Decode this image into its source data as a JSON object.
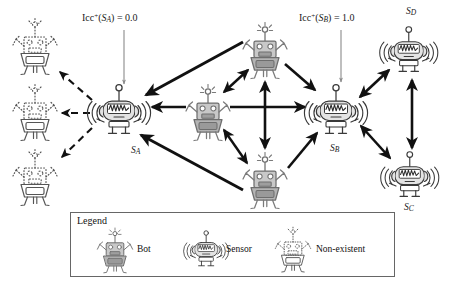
{
  "figure": {
    "kind": "robot-network-diagram",
    "background": "#ffffff",
    "colors": {
      "bot_fill": "#b8b8b8",
      "sensor_fill": "#e0e0e0",
      "stroke": "#3a3a3a",
      "arrow_solid": "#111111",
      "arrow_dashed": "#111111",
      "thin_arrow": "#8a8a8a",
      "legend_border": "#666666",
      "nonexistent_stroke": "#555555"
    }
  },
  "annotations": {
    "icc_a": {
      "metric": "Icc",
      "superscript": "+",
      "arg": "S",
      "arg_sub": "A",
      "eq": "=",
      "value": "0.0",
      "full": "Icc+(SA) = 0.0"
    },
    "icc_b": {
      "metric": "Icc",
      "superscript": "+",
      "arg": "S",
      "arg_sub": "B",
      "eq": "=",
      "value": "1.0",
      "full": "Icc+(SB) = 1.0"
    }
  },
  "nodes": [
    {
      "id": "sensor_A",
      "label_base": "S",
      "label_sub": "A",
      "type": "sensor",
      "x": 120,
      "y": 113,
      "scale": 1.0
    },
    {
      "id": "sensor_B",
      "label_base": "S",
      "label_sub": "B",
      "type": "sensor",
      "x": 337,
      "y": 110,
      "scale": 1.0
    },
    {
      "id": "sensor_D",
      "label_base": "S",
      "label_sub": "D",
      "type": "sensor",
      "x": 409,
      "y": 50,
      "scale": 0.92
    },
    {
      "id": "sensor_C",
      "label_base": "S",
      "label_sub": "C",
      "type": "sensor",
      "x": 410,
      "y": 178,
      "scale": 0.92
    },
    {
      "id": "bot_center",
      "label_base": "",
      "label_sub": "",
      "type": "bot",
      "x": 208,
      "y": 113,
      "scale": 1.0
    },
    {
      "id": "bot_top",
      "label_base": "",
      "label_sub": "",
      "type": "bot",
      "x": 265,
      "y": 52,
      "scale": 1.0
    },
    {
      "id": "bot_bottom",
      "label_base": "",
      "label_sub": "",
      "type": "bot",
      "x": 265,
      "y": 182,
      "scale": 1.0
    },
    {
      "id": "ghost_top",
      "label_base": "",
      "label_sub": "",
      "type": "non-existent",
      "x": 35,
      "y": 47,
      "scale": 1.0
    },
    {
      "id": "ghost_mid",
      "label_base": "",
      "label_sub": "",
      "type": "non-existent",
      "x": 35,
      "y": 113,
      "scale": 1.0
    },
    {
      "id": "ghost_bottom",
      "label_base": "",
      "label_sub": "",
      "type": "non-existent",
      "x": 35,
      "y": 178,
      "scale": 1.0
    }
  ],
  "node_labels": [
    {
      "name": "label-sa",
      "base": "S",
      "sub": "A",
      "x": 131,
      "y": 145
    },
    {
      "name": "label-sb",
      "base": "S",
      "sub": "B",
      "x": 330,
      "y": 143
    },
    {
      "name": "label-sd",
      "base": "S",
      "sub": "D",
      "x": 406,
      "y": 6
    },
    {
      "name": "label-sc",
      "base": "S",
      "sub": "C",
      "x": 404,
      "y": 202
    }
  ],
  "legend": {
    "title": "Legend",
    "box": {
      "x": 70,
      "y": 212,
      "w": 323,
      "h": 63
    },
    "entries": [
      {
        "icon": "bot-icon",
        "label": "Bot"
      },
      {
        "icon": "sensor-icon",
        "label": "Sensor"
      },
      {
        "icon": "non-existent-icon",
        "label": "Non-existent"
      }
    ]
  }
}
